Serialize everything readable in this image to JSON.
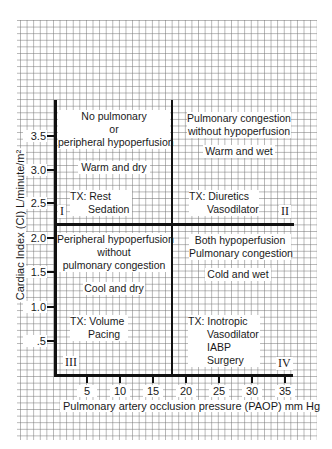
{
  "diagram": {
    "type": "quadrant-plot",
    "y_axis": {
      "title": "Cardiac Index (CI) L/minute/m²",
      "ticks": [
        ".5",
        "1.0",
        "1.5",
        "2.0",
        "2.5",
        "3.0",
        "3.5"
      ],
      "divider_value": 2.2
    },
    "x_axis": {
      "title": "Pulmonary artery occlusion pressure (PAOP) mm Hg",
      "ticks": [
        "5",
        "10",
        "15",
        "20",
        "25",
        "30",
        "35"
      ],
      "divider_value": 18
    },
    "quadrants": {
      "q1": {
        "numeral": "I",
        "title_lines": [
          "No pulmonary",
          "or",
          "peripheral hypoperfusion"
        ],
        "state": "Warm and dry",
        "tx_lines": [
          "TX: Rest",
          "Sedation"
        ]
      },
      "q2": {
        "numeral": "II",
        "title_lines": [
          "Pulmonary congestion",
          "without hypoperfusion"
        ],
        "state": "Warm and wet",
        "tx_lines": [
          "TX: Diuretics",
          "Vasodilator"
        ]
      },
      "q3": {
        "numeral": "III",
        "title_lines": [
          "Peripheral hypoperfusion",
          "without",
          "pulmonary congestion"
        ],
        "state": "Cool and dry",
        "tx_lines": [
          "TX: Volume",
          "Pacing"
        ]
      },
      "q4": {
        "numeral": "IV",
        "title_lines": [
          "Both hypoperfusion",
          "Pulmonary congestion"
        ],
        "state": "Cold and wet",
        "tx_lines": [
          "TX: Inotropic",
          "Vasodilator",
          "IABP",
          "Surgery"
        ]
      }
    }
  }
}
